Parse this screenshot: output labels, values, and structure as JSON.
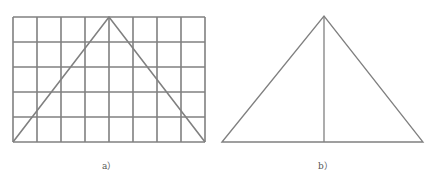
{
  "figure_a": {
    "caption": "a）",
    "grid": {
      "cols": 8,
      "rows": 5,
      "x": 13,
      "y": 17,
      "width": 192,
      "height": 125
    },
    "triangle": {
      "left": [
        13,
        142
      ],
      "apex": [
        109,
        17
      ],
      "right": [
        205,
        142
      ]
    }
  },
  "figure_b": {
    "caption": "b）",
    "triangle": {
      "left": [
        222,
        142
      ],
      "apex": [
        324,
        16
      ],
      "right": [
        423,
        142
      ]
    },
    "altitude": {
      "top": [
        324,
        16
      ],
      "bottom": [
        324,
        142
      ]
    }
  },
  "colors": {
    "stroke": "#808080",
    "background": "#ffffff"
  }
}
